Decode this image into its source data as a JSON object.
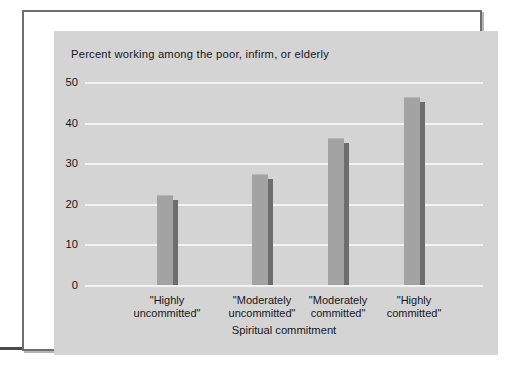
{
  "chart_data": {
    "type": "bar",
    "title": "Percent working among the poor, infirm, or elderly",
    "xlabel": "Spiritual commitment",
    "ylabel": "",
    "categories": [
      "\"Highly uncommitted\"",
      "\"Moderately uncommitted\"",
      "\"Moderately committed\"",
      "\"Highly committed\""
    ],
    "category_lines": [
      [
        "\"Highly",
        "uncommitted\""
      ],
      [
        "\"Moderately",
        "uncommitted\""
      ],
      [
        "\"Moderately",
        "committed\""
      ],
      [
        "\"Highly",
        "committed\""
      ]
    ],
    "values": [
      22,
      27,
      36,
      46
    ],
    "ylim": [
      0,
      50
    ],
    "yticks": [
      0,
      10,
      20,
      30,
      40,
      50
    ],
    "ytick_labels": [
      "0",
      "10",
      "20",
      "30",
      "40",
      "50"
    ],
    "grid": true,
    "gridline_color": "#f3f3f3",
    "legend": null,
    "bar_color": "#a3a3a3",
    "bar_shadow_color": "#6d6d6d",
    "panel_color": "#d4d4d4",
    "frame_color": "#6e6e70",
    "text_color": "#16161a"
  }
}
